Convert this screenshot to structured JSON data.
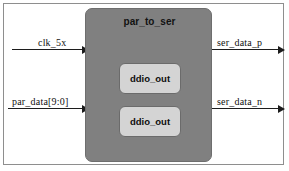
{
  "diagram": {
    "type": "block-diagram",
    "background_color": "#ffffff",
    "frame_border_color": "#8e8e8e",
    "module": {
      "title": "par_to_ser",
      "fill_color": "#808080",
      "border_color": "#6e6e6e",
      "sub_blocks": [
        {
          "label": "ddio_out",
          "fill_color": "#d4d4d4",
          "border_color": "#6b6b6b"
        },
        {
          "label": "ddio_out",
          "fill_color": "#d4d4d4",
          "border_color": "#6b6b6b"
        }
      ]
    },
    "signals": {
      "inputs": [
        {
          "label": "clk_5x",
          "direction": "in"
        },
        {
          "label": "par_data[9:0]",
          "direction": "in"
        }
      ],
      "outputs": [
        {
          "label": "ser_data_p",
          "direction": "out"
        },
        {
          "label": "ser_data_n",
          "direction": "out"
        }
      ]
    },
    "line_color": "#1c1c1c"
  }
}
